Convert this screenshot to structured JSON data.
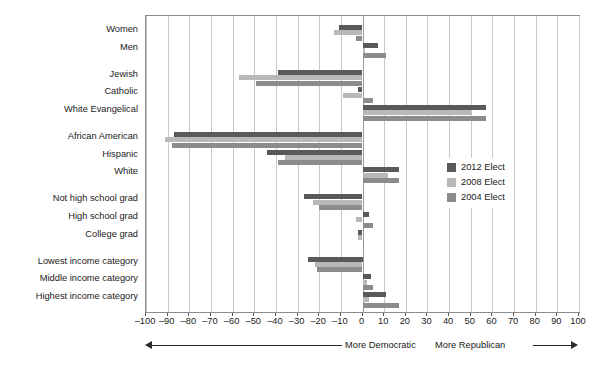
{
  "chart_data": {
    "type": "bar",
    "orientation": "horizontal",
    "title": "",
    "subtitle": "",
    "xlabel": "",
    "ylabel": "",
    "xlim": [
      -100,
      100
    ],
    "xticks": [
      -100,
      -90,
      -80,
      -70,
      -60,
      -50,
      -40,
      -30,
      -20,
      -10,
      0,
      10,
      20,
      30,
      40,
      50,
      60,
      70,
      80,
      90,
      100
    ],
    "xticklabels": [
      "–100",
      "–90",
      "–80",
      "–70",
      "–60",
      "–50",
      "–40",
      "–30",
      "–20",
      "–10",
      "0",
      "10",
      "20",
      "30",
      "40",
      "50",
      "60",
      "70",
      "80",
      "90",
      "100"
    ],
    "grid": true,
    "grid_axis": "x",
    "legend_position": "center-right-inside",
    "categories": [
      "Women",
      "Men",
      "Jewish",
      "Catholic",
      "White Evangelical",
      "African American",
      "Hispanic",
      "White",
      "Not high school grad",
      "High school grad",
      "College grad",
      "Lowest income category",
      "Middle income category",
      "Highest income category"
    ],
    "group_breaks_after": [
      "Men",
      "White Evangelical",
      "White",
      "College grad"
    ],
    "series": [
      {
        "name": "2012 Elect",
        "color": "#595959",
        "values": [
          -11,
          7,
          -39,
          -2,
          57,
          -87,
          -44,
          17,
          -27,
          3,
          -2,
          -25,
          4,
          11
        ]
      },
      {
        "name": "2008 Elect",
        "color": "#b8b8b8",
        "values": [
          -13,
          1,
          -57,
          -9,
          50,
          -91,
          -36,
          12,
          -23,
          -3,
          -2,
          -22,
          2,
          3
        ]
      },
      {
        "name": "2004 Elect",
        "color": "#8c8c8c",
        "values": [
          -3,
          11,
          -49,
          5,
          57,
          -88,
          -39,
          17,
          -20,
          5,
          0,
          -21,
          5,
          17
        ]
      }
    ],
    "annotations": {
      "left_direction": "More Democratic",
      "right_direction": "More Republican"
    }
  },
  "legend": {
    "items": [
      {
        "label": "2012 Elect",
        "color": "#595959"
      },
      {
        "label": "2008 Elect",
        "color": "#b8b8b8"
      },
      {
        "label": "2004 Elect",
        "color": "#8c8c8c"
      }
    ]
  }
}
